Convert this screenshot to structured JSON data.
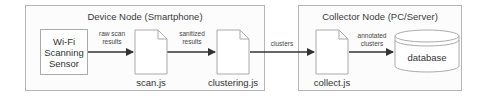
{
  "device_node": {
    "title": "Device Node (Smartphone)",
    "sensor": "Wi-Fi\nScanning\nSensor",
    "scan_file": "scan.js",
    "clustering_file": "clustering.js",
    "edge_raw": "raw scan\nresults",
    "edge_sanitized": "sanitized\nresults"
  },
  "edge_clusters": "clusters",
  "collector_node": {
    "title": "Collector Node (PC/Server)",
    "collect_file": "collect.js",
    "edge_annotated": "annotated\nclusters",
    "database": "database"
  },
  "colors": {
    "border": "#b5b5b5",
    "arrow": "#333333",
    "background": "#fcfcfc"
  }
}
